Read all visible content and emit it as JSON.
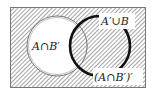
{
  "diagram": {
    "type": "venn",
    "universal_set": {
      "shaded": true,
      "x": 10,
      "y": 7,
      "width": 136,
      "height": 81
    },
    "sets": [
      {
        "name": "A",
        "cx": 57,
        "cy": 46,
        "r": 30,
        "style": "double-thin-outline",
        "fill": "#ffffff"
      },
      {
        "name": "B",
        "cx": 100,
        "cy": 46,
        "r": 30,
        "style": "thick-black-arc",
        "fill": "none"
      }
    ],
    "labels": {
      "a_and_not_b": "A∩B′",
      "not_a_or_b": "A′∪B",
      "complement_a_and_not_b": "(A∩B′)′"
    },
    "colors": {
      "hatch": "#555555",
      "background": "#ffffff",
      "outline": "#111111"
    }
  }
}
